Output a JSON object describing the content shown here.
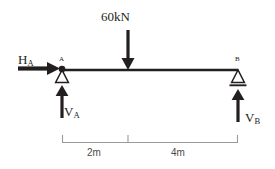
{
  "diagram": {
    "type": "beam-free-body-diagram",
    "colors": {
      "ink": "#231f20",
      "beam": "#231f20",
      "dimension": "#9a9a9a",
      "dimension_text": "#4a4a4a",
      "background": "#ffffff"
    },
    "beam": {
      "start_x": 62,
      "end_x": 238,
      "y": 70,
      "total_length_label": "6m"
    },
    "loads": [
      {
        "name": "point-load",
        "label": "60kN",
        "magnitude": 60,
        "unit": "kN",
        "direction": "down",
        "position_x": 128,
        "distance_from_a": "2m"
      }
    ],
    "reactions": [
      {
        "name": "horizontal-reaction-a",
        "label_main": "H",
        "label_sub": "A",
        "direction": "right",
        "at_node": "A"
      },
      {
        "name": "vertical-reaction-a",
        "label_main": "V",
        "label_sub": "A",
        "direction": "up",
        "at_node": "A"
      },
      {
        "name": "vertical-reaction-b",
        "label_main": "V",
        "label_sub": "B",
        "direction": "up",
        "at_node": "B"
      }
    ],
    "supports": [
      {
        "name": "support-a",
        "node_label": "A",
        "support_type": "pin",
        "position_x": 62
      },
      {
        "name": "support-b",
        "node_label": "B",
        "support_type": "roller",
        "position_x": 238
      }
    ],
    "dimensions": [
      {
        "name": "dimension-a-to-load",
        "label": "2m",
        "from_x": 62,
        "to_x": 128
      },
      {
        "name": "dimension-load-to-b",
        "label": "4m",
        "from_x": 128,
        "to_x": 238
      }
    ]
  }
}
